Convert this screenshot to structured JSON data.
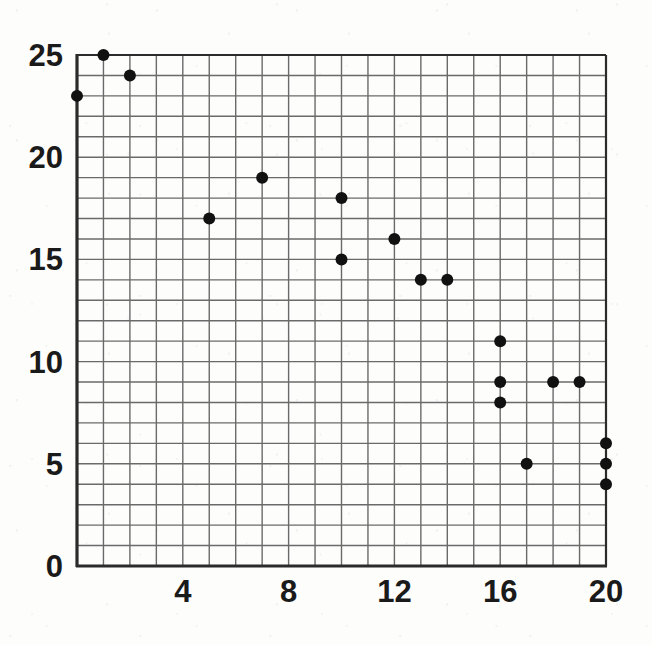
{
  "chart_data": {
    "type": "scatter",
    "title": "",
    "xlabel": "",
    "ylabel": "",
    "xlim": [
      0,
      20
    ],
    "ylim": [
      0,
      25
    ],
    "grid": true,
    "grid_step_x": 1,
    "grid_step_y": 1,
    "legend": "none",
    "xticks": [
      4,
      8,
      12,
      16,
      20
    ],
    "yticks": [
      0,
      5,
      10,
      15,
      20,
      25
    ],
    "xtick_labels": [
      "4",
      "8",
      "12",
      "16",
      "20"
    ],
    "ytick_labels": [
      "0",
      "5",
      "10",
      "15",
      "20",
      "25"
    ],
    "point_count": 23,
    "points": [
      {
        "x": 0,
        "y": 23
      },
      {
        "x": 1,
        "y": 25
      },
      {
        "x": 2,
        "y": 24
      },
      {
        "x": 5,
        "y": 17
      },
      {
        "x": 7,
        "y": 19
      },
      {
        "x": 10,
        "y": 18
      },
      {
        "x": 10,
        "y": 15
      },
      {
        "x": 12,
        "y": 16
      },
      {
        "x": 13,
        "y": 14
      },
      {
        "x": 14,
        "y": 14
      },
      {
        "x": 16,
        "y": 11
      },
      {
        "x": 16,
        "y": 9
      },
      {
        "x": 16,
        "y": 8
      },
      {
        "x": 17,
        "y": 5
      },
      {
        "x": 18,
        "y": 9
      },
      {
        "x": 19,
        "y": 9
      },
      {
        "x": 20,
        "y": 6
      },
      {
        "x": 20,
        "y": 5
      },
      {
        "x": 20,
        "y": 4
      }
    ],
    "marker": {
      "shape": "filled-circle",
      "color": "#111111",
      "radius_px": 6
    },
    "colors": {
      "grid": "#6a6a6a",
      "axis": "#2b2b2b",
      "marker": "#111111",
      "background": "#fdfdfc",
      "tick_text": "#1a1a1a"
    },
    "geometry": {
      "plot_left_px": 77,
      "plot_right_px": 606,
      "plot_top_px": 55,
      "plot_bottom_px": 566,
      "px_per_x_unit": 26.45,
      "px_per_y_unit": 20.44
    }
  }
}
